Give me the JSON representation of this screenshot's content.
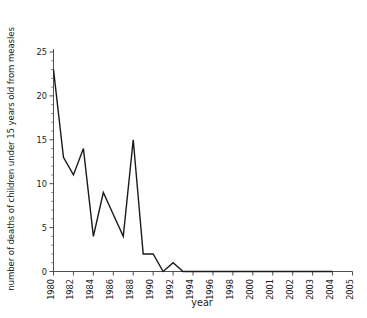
{
  "chart_data": {
    "type": "line",
    "title": "",
    "xlabel": "year",
    "ylabel": "number of deaths of children under 15 years old from measles",
    "xlim": [
      1980,
      2005
    ],
    "ylim": [
      0,
      25
    ],
    "ytick_labels": [
      "0",
      "5",
      "10",
      "15",
      "20",
      "25"
    ],
    "ytick_values": [
      0,
      5,
      10,
      15,
      20,
      25
    ],
    "y_minor_tick_step": 1,
    "xtick_labels": [
      "1980",
      "1982",
      "1984",
      "1986",
      "1988",
      "1990",
      "1992",
      "1994",
      "1996",
      "1998",
      "2000",
      "2001",
      "2002",
      "2003",
      "2004",
      "2005"
    ],
    "xtick_values": [
      1980,
      1982,
      1984,
      1986,
      1988,
      1990,
      1992,
      1994,
      1996,
      1998,
      2000,
      2001,
      2002,
      2003,
      2004,
      2005
    ],
    "x_axis_spacing": "categorical-uniform",
    "grid": false,
    "legend": null,
    "line_color": "#1a1a1a",
    "line_width": 1.4,
    "x": [
      1980,
      1981,
      1982,
      1983,
      1984,
      1985,
      1986,
      1987,
      1988,
      1989,
      1990,
      1991,
      1992,
      1993,
      1994,
      1995,
      1996,
      1997,
      1998,
      1999,
      2000,
      2001,
      2002,
      2003,
      2004
    ],
    "values": [
      23,
      13,
      11,
      14,
      4,
      9,
      6.5,
      4,
      15,
      2,
      2,
      0,
      1,
      0,
      0,
      0,
      0,
      0,
      0,
      0,
      0,
      0,
      0,
      0,
      0
    ],
    "series": [
      {
        "name": "deaths from measles",
        "values": [
          23,
          13,
          11,
          14,
          4,
          9,
          6.5,
          4,
          15,
          2,
          2,
          0,
          1,
          0,
          0,
          0,
          0,
          0,
          0,
          0,
          0,
          0,
          0,
          0,
          0
        ]
      }
    ]
  }
}
